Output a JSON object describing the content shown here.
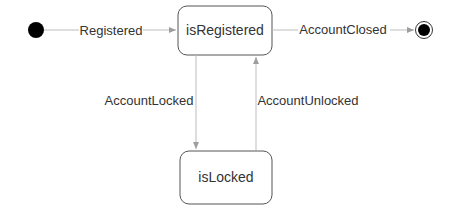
{
  "diagram": {
    "type": "state-machine",
    "colors": {
      "edge": "#bdbdbd",
      "state_border": "#555555",
      "text": "#333333",
      "pseudostate_fill": "#000000"
    },
    "states": [
      {
        "id": "initial",
        "kind": "initial"
      },
      {
        "id": "isRegistered",
        "label": "isRegistered"
      },
      {
        "id": "isLocked",
        "label": "isLocked"
      },
      {
        "id": "final",
        "kind": "final"
      }
    ],
    "transitions": [
      {
        "from": "initial",
        "to": "isRegistered",
        "label": "Registered"
      },
      {
        "from": "isRegistered",
        "to": "final",
        "label": "AccountClosed"
      },
      {
        "from": "isRegistered",
        "to": "isLocked",
        "label": "AccountLocked"
      },
      {
        "from": "isLocked",
        "to": "isRegistered",
        "label": "AccountUnlocked"
      }
    ]
  }
}
